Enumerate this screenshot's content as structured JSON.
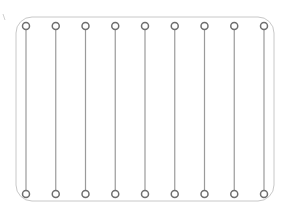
{
  "diagram": {
    "frame": {
      "x": 16,
      "y": 17,
      "width": 258,
      "height": 184,
      "radius": 16,
      "stroke": "#c8c8c8"
    },
    "line_color": "#9a9a9a",
    "circle_stroke": "#6e6e6e",
    "circle_radius": 3.5,
    "top_y": 26,
    "bottom_y": 194,
    "columns": [
      26,
      55.75,
      85.5,
      115.25,
      145,
      174.75,
      204.5,
      234.25,
      264
    ],
    "left_marker": {
      "x": 3,
      "y": 14
    }
  }
}
